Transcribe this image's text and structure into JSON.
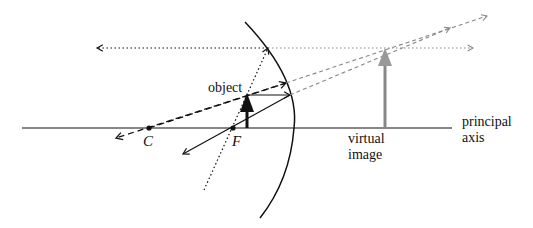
{
  "diagram": {
    "labels": {
      "object": "object",
      "center": "C",
      "focus": "F",
      "virtual_image_line1": "virtual",
      "virtual_image_line2": "image",
      "axis_line1": "principal",
      "axis_line2": "axis"
    },
    "colors": {
      "ink": "#111111",
      "virtual": "#888888",
      "background": "#ffffff"
    },
    "geometry": {
      "principal_axis": {
        "x1": 22,
        "y1": 128,
        "x2": 452,
        "y2": 128
      },
      "mirror_path": "M245,22 Q300,80 294,128 Q290,180 260,218",
      "center_point": {
        "x": 149,
        "y": 128
      },
      "focus_point": {
        "x": 233,
        "y": 128
      },
      "object_arrow": {
        "x": 247,
        "y_base": 128,
        "y_tip": 95
      },
      "virtual_image_arrow": {
        "x": 385,
        "y_base": 128,
        "y_tip": 48
      }
    },
    "rays": [
      {
        "name": "parallel-ray",
        "style": "solid",
        "description": "from object tip parallel to axis, reflects through F"
      },
      {
        "name": "focal-ray",
        "style": "dotted",
        "description": "through F, reflects parallel to axis"
      },
      {
        "name": "center-ray",
        "style": "dashed",
        "description": "through C, reflects back on itself"
      }
    ]
  }
}
